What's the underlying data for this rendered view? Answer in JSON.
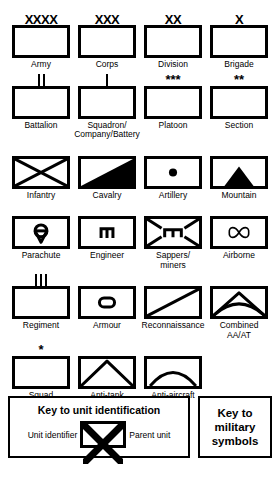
{
  "symbols": [
    {
      "label": "Army",
      "echelon": "XXXX",
      "echelon_type": "text",
      "glyph": "empty"
    },
    {
      "label": "Corps",
      "echelon": "XXX",
      "echelon_type": "text",
      "glyph": "empty"
    },
    {
      "label": "Division",
      "echelon": "XX",
      "echelon_type": "text",
      "glyph": "empty"
    },
    {
      "label": "Brigade",
      "echelon": "X",
      "echelon_type": "text",
      "glyph": "empty"
    },
    {
      "label": "Battalion",
      "echelon": "||",
      "echelon_type": "bars2",
      "glyph": "empty"
    },
    {
      "label": "Squadron/\nCompany/Battery",
      "echelon": "|",
      "echelon_type": "bars1",
      "glyph": "empty"
    },
    {
      "label": "Platoon",
      "echelon": "***",
      "echelon_type": "stars",
      "glyph": "empty"
    },
    {
      "label": "Section",
      "echelon": "**",
      "echelon_type": "stars",
      "glyph": "empty"
    },
    {
      "label": "Infantry",
      "echelon": "",
      "echelon_type": "none",
      "glyph": "cross"
    },
    {
      "label": "Cavalry",
      "echelon": "",
      "echelon_type": "none",
      "glyph": "cavalry"
    },
    {
      "label": "Artillery",
      "echelon": "",
      "echelon_type": "none",
      "glyph": "dot"
    },
    {
      "label": "Mountain",
      "echelon": "",
      "echelon_type": "none",
      "glyph": "mountain"
    },
    {
      "label": "Parachute",
      "echelon": "",
      "echelon_type": "none",
      "glyph": "parachute"
    },
    {
      "label": "Engineer",
      "echelon": "",
      "echelon_type": "none",
      "glyph": "engineer"
    },
    {
      "label": "Sappers/\nminers",
      "echelon": "",
      "echelon_type": "none",
      "glyph": "sappers"
    },
    {
      "label": "Airborne",
      "echelon": "",
      "echelon_type": "none",
      "glyph": "airborne"
    },
    {
      "label": "Regiment",
      "echelon": "|||",
      "echelon_type": "bars3",
      "glyph": "empty"
    },
    {
      "label": "Armour",
      "echelon": "",
      "echelon_type": "none",
      "glyph": "armour"
    },
    {
      "label": "Reconnaissance",
      "echelon": "",
      "echelon_type": "none",
      "glyph": "recon"
    },
    {
      "label": "Combined\nAA/AT",
      "echelon": "",
      "echelon_type": "none",
      "glyph": "combined"
    },
    {
      "label": "Squad",
      "echelon": "*",
      "echelon_type": "stars",
      "glyph": "empty"
    },
    {
      "label": "Anti-tank",
      "echelon": "",
      "echelon_type": "none",
      "glyph": "antitank"
    },
    {
      "label": "Anti-aircraft",
      "echelon": "",
      "echelon_type": "none",
      "glyph": "antiair"
    }
  ],
  "legend": {
    "title": "Key to unit identification",
    "left_label": "Unit identifier",
    "right_label": "Parent unit",
    "key_title": "Key to\nmilitary\nsymbols"
  }
}
